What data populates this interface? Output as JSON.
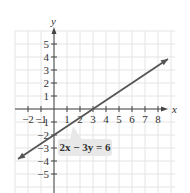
{
  "chart_data": {
    "type": "line",
    "title": "",
    "xlabel": "x",
    "ylabel": "y",
    "xlim": [
      -3,
      9
    ],
    "ylim": [
      -6,
      6
    ],
    "grid": true,
    "x_ticks": [
      -2,
      -1,
      1,
      2,
      3,
      4,
      5,
      6,
      7,
      8
    ],
    "y_ticks": [
      5,
      4,
      3,
      2,
      1,
      -1,
      -2,
      -3,
      -4,
      -5
    ],
    "x_tick_labels": [
      "−2",
      "−1",
      "1",
      "2",
      "3",
      "4",
      "5",
      "6",
      "7",
      "8"
    ],
    "y_tick_labels": [
      "5",
      "4",
      "3",
      "2",
      "1",
      "−1",
      "−2",
      "−3",
      "−4",
      "−5"
    ],
    "series": [
      {
        "name": "2x − 3y = 6",
        "equation": "2x - 3y = 6",
        "slope": 0.6667,
        "y_intercept": -2,
        "x_intercept": 3,
        "x": [
          -2.77,
          0,
          3,
          8.77
        ],
        "y": [
          -3.85,
          -2,
          0,
          3.85
        ],
        "arrows": "both",
        "color": "#555555"
      }
    ],
    "annotations": [
      {
        "text": "2x − 3y = 6",
        "anchor_point": [
          1.6,
          -1.0
        ],
        "position": "below-right callout box"
      }
    ]
  },
  "labels": {
    "x_axis": "x",
    "y_axis": "y",
    "equation": "2x − 3y = 6"
  },
  "colors": {
    "grid": "#e4e4e4",
    "axis": "#444444",
    "line": "#555555",
    "callout_fill": "#e8e8e8"
  }
}
